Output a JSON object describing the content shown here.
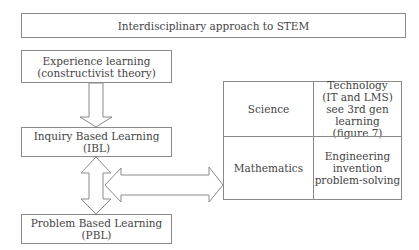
{
  "title": "Interdisciplinary approach to STEM",
  "boxes": {
    "experience": "Experience learning\n(constructivist theory)",
    "ibl": "Inquiry Based Learning (IBL)",
    "pbl": "Problem Based Learning (PBL)"
  },
  "grid": {
    "science": "Science",
    "technology": "Technology\n(IT and LMS)\nsee 3rd gen\nlearning\n(figure 7)",
    "mathematics": "Mathematics",
    "engineering": "Engineering\ninvention\nproblem-solving"
  }
}
